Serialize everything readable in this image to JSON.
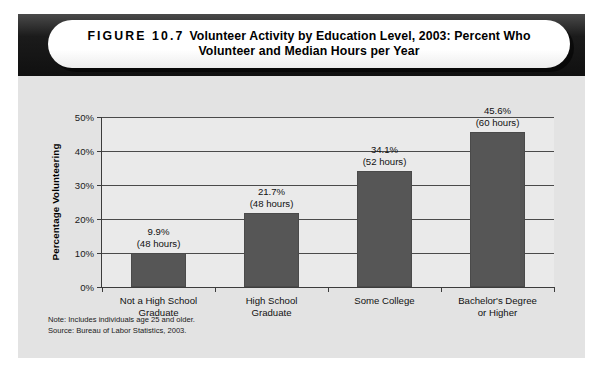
{
  "figure": {
    "label": "FIGURE 10.7",
    "title_line1": "Volunteer Activity by Education Level, 2003: Percent Who",
    "title_line2": "Volunteer and Median Hours per Year"
  },
  "notes": {
    "note": "Note: Includes individuals age 25 and older.",
    "source": "Source: Bureau of Labor Statistics, 2003."
  },
  "colors": {
    "bar_fill": "#565656",
    "header_band": "#161616",
    "card_background": "#e3e3e3",
    "plot_background": "#eaeaea",
    "axis": "#3c3c3c"
  },
  "chart_data": {
    "type": "bar",
    "title": "Volunteer Activity by Education Level, 2003: Percent Who Volunteer and Median Hours per Year",
    "xlabel": "",
    "ylabel": "Percentage Volunteering",
    "ylim": [
      0,
      50
    ],
    "ytick_labels": [
      "0%",
      "10%",
      "20%",
      "30%",
      "40%",
      "50%"
    ],
    "ytick_values": [
      0,
      10,
      20,
      30,
      40,
      50
    ],
    "grid": true,
    "legend": "none",
    "categories": [
      "Not a High School Graduate",
      "High School Graduate",
      "Some College",
      "Bachelor's Degree or Higher"
    ],
    "category_lines": [
      [
        "Not a High School",
        "Graduate"
      ],
      [
        "High School",
        "Graduate"
      ],
      [
        "Some College",
        ""
      ],
      [
        "Bachelor's Degree",
        "or Higher"
      ]
    ],
    "values": [
      9.9,
      21.7,
      34.1,
      45.6
    ],
    "value_labels": [
      "9.9%",
      "21.7%",
      "34.1%",
      "45.6%"
    ],
    "median_hours": [
      48,
      48,
      52,
      60
    ],
    "median_hours_labels": [
      "(48 hours)",
      "(48 hours)",
      "(52 hours)",
      "(60 hours)"
    ]
  }
}
